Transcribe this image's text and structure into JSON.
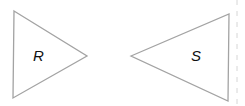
{
  "diagram": {
    "type": "geometry-figures",
    "colors": {
      "stroke": "#a3a3a3",
      "label": "#111111",
      "background": "#ffffff"
    },
    "shapes": [
      {
        "id": "R",
        "label": "R",
        "kind": "triangle",
        "points": "14,11 87,56 13,98",
        "label_pos": {
          "x": 33,
          "y": 61
        }
      },
      {
        "id": "S",
        "label": "S",
        "kind": "triangle",
        "points": "131,56 229,14 228,101",
        "label_pos": {
          "x": 191,
          "y": 61
        }
      }
    ]
  }
}
